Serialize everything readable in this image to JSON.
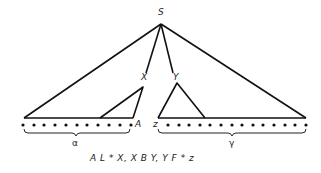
{
  "diagram": {
    "nodes": {
      "root": "S",
      "left_child": "X",
      "right_child": "Y",
      "left_leaf": "A",
      "right_leaf": "z"
    },
    "braces": {
      "left": "α",
      "right": "γ"
    },
    "caption": "A L * X, X B Y, Y F * z",
    "left_dot_count": 11,
    "right_dot_count": 14,
    "line_color": "#111111"
  }
}
